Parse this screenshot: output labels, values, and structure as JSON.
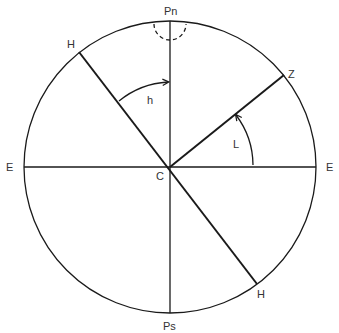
{
  "diagram": {
    "type": "celestial-sphere-meridian-diagram",
    "labels": {
      "north_pole": "Pn",
      "south_pole": "Ps",
      "east_left": "E",
      "east_right": "E",
      "center": "C",
      "horizon_upper": "H",
      "horizon_lower": "H",
      "zenith": "Z",
      "hour_angle": "h",
      "latitude": "L"
    },
    "colors": {
      "line": "#1a1a1a",
      "text": "#333333",
      "background": "#ffffff"
    }
  }
}
